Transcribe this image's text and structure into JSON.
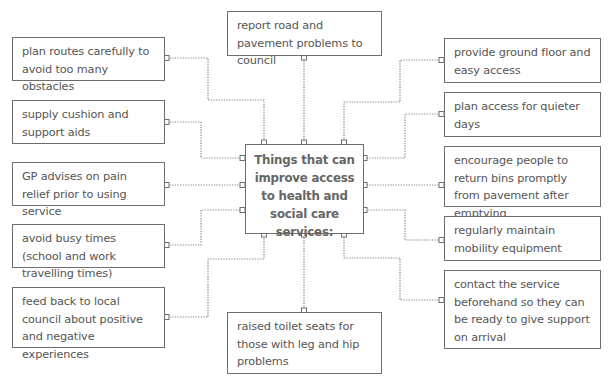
{
  "diagram": {
    "type": "spider diagram",
    "center": {
      "label": "Things that can improve access to health and social care services:"
    },
    "top": {
      "label": "report road and pavement problems to council"
    },
    "bottom": {
      "label": "raised toilet seats for those with leg and hip problems"
    },
    "left": [
      {
        "label": "plan routes carefully to avoid too many obstacles"
      },
      {
        "label": "supply cushion and support aids"
      },
      {
        "label": "GP advises on pain relief prior to using service"
      },
      {
        "label": "avoid busy times (school and work travelling times)"
      },
      {
        "label": "feed back to local council about positive and negative experiences"
      }
    ],
    "right": [
      {
        "label": "provide ground floor and easy access"
      },
      {
        "label": "plan access for quieter days"
      },
      {
        "label": "encourage people to return bins promptly from pavement after emptying"
      },
      {
        "label": "regularly maintain mobility equipment"
      },
      {
        "label": "contact the service beforehand so they can be ready to give support on arrival"
      }
    ],
    "colors": {
      "border": "#6e6e6e",
      "text": "#555555",
      "connector": "#8a8a8a",
      "background": "#ffffff"
    }
  }
}
